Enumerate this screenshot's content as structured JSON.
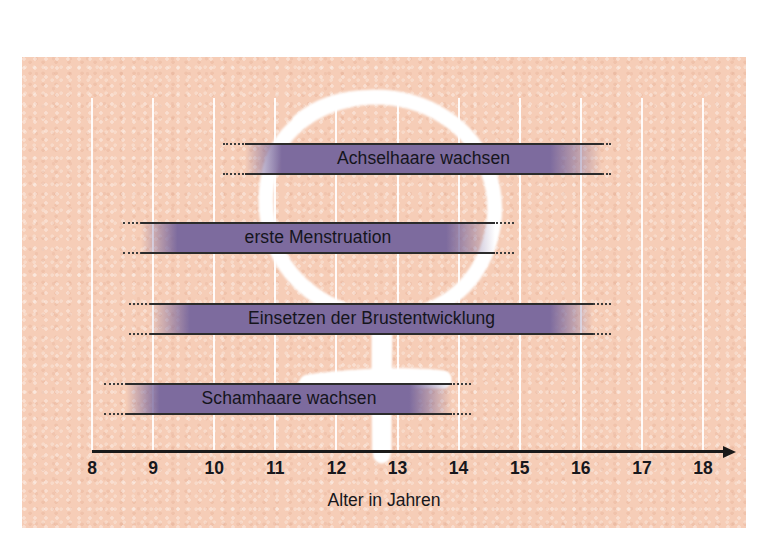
{
  "figure": {
    "caption": "Alter in Jahren",
    "panel_color": "#f6cdb7",
    "bar_color": "#7d6b9e",
    "axis_color": "#1a1a1a",
    "gridline_color": "#ffffff",
    "symbol": "venus-symbol-female"
  },
  "chart_data": {
    "type": "bar",
    "orientation": "horizontal",
    "title": "",
    "xlabel": "Alter in Jahren",
    "ylabel": "",
    "xlim": [
      8,
      18
    ],
    "grid": true,
    "legend": "none",
    "tick_labels": [
      "8",
      "9",
      "10",
      "11",
      "12",
      "13",
      "14",
      "15",
      "16",
      "17",
      "18"
    ],
    "tick_values": [
      8,
      9,
      10,
      11,
      12,
      13,
      14,
      15,
      16,
      17,
      18
    ],
    "categories": [
      "Achselhaare wachsen",
      "erste Menstruation",
      "Einsetzen der Brustentwicklung",
      "Schamhaare wachsen"
    ],
    "bars": [
      {
        "label": "Achselhaare wachsen",
        "start": 10.5,
        "end": 16.35,
        "fade_start": 11.1,
        "fade_end": 15.5,
        "dot_start": 10.15,
        "dot_end": 16.5
      },
      {
        "label": "erste Menstruation",
        "start": 8.8,
        "end": 14.6,
        "fade_start": 9.4,
        "fade_end": 13.8,
        "dot_start": 8.5,
        "dot_end": 14.9
      },
      {
        "label": "Einsetzen der Brustentwicklung",
        "start": 8.95,
        "end": 16.2,
        "fade_start": 9.6,
        "fade_end": 15.5,
        "dot_start": 8.6,
        "dot_end": 16.5
      },
      {
        "label": "Schamhaare wachsen",
        "start": 8.55,
        "end": 13.9,
        "fade_start": 9.1,
        "fade_end": 13.2,
        "dot_start": 8.2,
        "dot_end": 14.2
      }
    ]
  }
}
